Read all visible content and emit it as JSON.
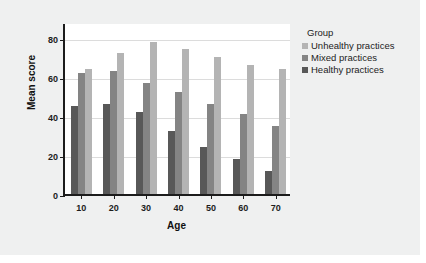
{
  "chart_data": {
    "type": "bar",
    "title": "",
    "xlabel": "Age",
    "ylabel": "Mean score",
    "categories": [
      "10",
      "20",
      "30",
      "40",
      "50",
      "60",
      "70"
    ],
    "ylim": [
      0,
      88
    ],
    "yticks": [
      0,
      20,
      40,
      60,
      80
    ],
    "grid": true,
    "legend_title": "Group",
    "legend_position": "right",
    "series": [
      {
        "name": "Healthy practices",
        "color": "#585858",
        "values": [
          45,
          46,
          42,
          32,
          24,
          18,
          12
        ]
      },
      {
        "name": "Mixed practices",
        "color": "#848484",
        "values": [
          62,
          63,
          57,
          52,
          46,
          41,
          35
        ]
      },
      {
        "name": "Unhealthy practices",
        "color": "#b4b4b4",
        "values": [
          64,
          72,
          78,
          74,
          70,
          66,
          64
        ]
      }
    ],
    "legend_order": [
      "Unhealthy practices",
      "Mixed practices",
      "Healthy practices"
    ]
  },
  "colors": {
    "figure_background": "#eff0f0",
    "plot_background": "#ffffff",
    "axis": "#1c1c1c",
    "gridline": "#dcdcdc"
  }
}
